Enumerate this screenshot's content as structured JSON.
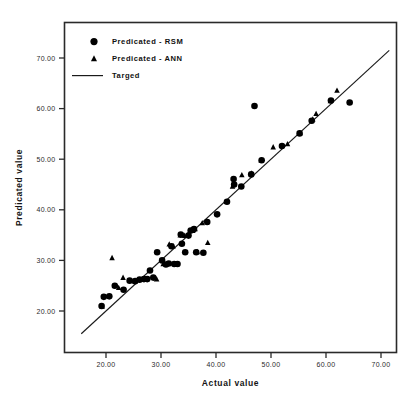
{
  "chart_data": {
    "type": "scatter",
    "title": "",
    "xlabel": "Actual value",
    "ylabel": "Predicated value",
    "xlim": [
      14.0,
      73.0
    ],
    "ylim": [
      15.5,
      74.0
    ],
    "xticks": [
      20,
      30,
      40,
      50,
      60,
      70
    ],
    "yticks": [
      20,
      30,
      40,
      50,
      60,
      70
    ],
    "xticklabels": [
      "20.00",
      "30.00",
      "40.00",
      "50.00",
      "60.00",
      "70.00"
    ],
    "yticklabels": [
      "20.00",
      "30.00",
      "40.00",
      "50.00",
      "60.00",
      "70.00"
    ],
    "grid": false,
    "legend_position": "top-left",
    "legend": [
      {
        "label": "Predicated - RSM",
        "marker": "circle"
      },
      {
        "label": "Predicated - ANN",
        "marker": "triangle"
      },
      {
        "label": "Targed",
        "marker": "line"
      }
    ],
    "series": [
      {
        "name": "Predicated - RSM",
        "marker": "circle",
        "color": "#000000",
        "points": [
          [
            19.2,
            21.0
          ],
          [
            19.6,
            22.8
          ],
          [
            20.6,
            22.9
          ],
          [
            21.6,
            25.0
          ],
          [
            23.2,
            24.2
          ],
          [
            24.3,
            26.0
          ],
          [
            25.3,
            25.9
          ],
          [
            26.1,
            26.2
          ],
          [
            26.9,
            26.3
          ],
          [
            27.5,
            26.3
          ],
          [
            28.0,
            28.0
          ],
          [
            28.6,
            26.6
          ],
          [
            29.3,
            31.6
          ],
          [
            30.2,
            30.0
          ],
          [
            30.9,
            29.2
          ],
          [
            31.4,
            29.4
          ],
          [
            31.9,
            32.8
          ],
          [
            32.4,
            29.3
          ],
          [
            33.0,
            29.3
          ],
          [
            33.6,
            35.1
          ],
          [
            33.8,
            33.3
          ],
          [
            34.4,
            31.6
          ],
          [
            35.0,
            34.9
          ],
          [
            35.4,
            35.9
          ],
          [
            36.0,
            36.2
          ],
          [
            36.4,
            31.6
          ],
          [
            37.7,
            31.5
          ],
          [
            38.4,
            37.6
          ],
          [
            40.2,
            39.1
          ],
          [
            42.0,
            41.6
          ],
          [
            43.2,
            46.1
          ],
          [
            43.3,
            45.0
          ],
          [
            44.6,
            44.6
          ],
          [
            46.4,
            47.0
          ],
          [
            47.0,
            60.5
          ],
          [
            48.3,
            49.8
          ],
          [
            52.0,
            52.6
          ],
          [
            55.2,
            55.1
          ],
          [
            57.4,
            57.6
          ],
          [
            60.9,
            61.6
          ],
          [
            64.3,
            61.2
          ]
        ]
      },
      {
        "name": "Predicated - ANN",
        "marker": "triangle",
        "color": "#000000",
        "points": [
          [
            19.3,
            20.9
          ],
          [
            21.1,
            30.5
          ],
          [
            22.3,
            24.6
          ],
          [
            23.1,
            26.6
          ],
          [
            25.2,
            25.9
          ],
          [
            26.8,
            26.2
          ],
          [
            27.4,
            26.3
          ],
          [
            29.2,
            26.3
          ],
          [
            30.4,
            29.3
          ],
          [
            31.5,
            33.2
          ],
          [
            32.2,
            32.8
          ],
          [
            33.5,
            35.0
          ],
          [
            34.3,
            34.9
          ],
          [
            34.9,
            35.1
          ],
          [
            35.8,
            35.9
          ],
          [
            36.2,
            36.2
          ],
          [
            36.6,
            31.7
          ],
          [
            37.5,
            37.4
          ],
          [
            38.5,
            33.5
          ],
          [
            41.9,
            41.6
          ],
          [
            43.0,
            44.6
          ],
          [
            44.7,
            46.9
          ],
          [
            46.5,
            47.2
          ],
          [
            48.2,
            49.8
          ],
          [
            50.4,
            52.4
          ],
          [
            53.0,
            53.0
          ],
          [
            55.3,
            55.2
          ],
          [
            57.6,
            57.9
          ],
          [
            58.2,
            59.0
          ],
          [
            60.8,
            61.5
          ],
          [
            62.0,
            63.6
          ]
        ]
      }
    ],
    "reference_line": {
      "name": "Targed",
      "from": [
        15.5,
        15.5
      ],
      "to": [
        71.5,
        71.5
      ],
      "color": "#1a1a1a"
    }
  }
}
